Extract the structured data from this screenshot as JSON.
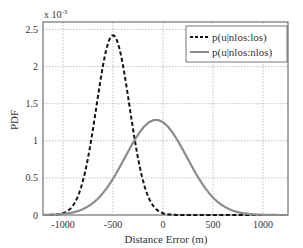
{
  "chart_data": {
    "type": "line",
    "title": "",
    "xlabel": "Distance Error (m)",
    "ylabel": "PDF",
    "y_scale_note": "x 10^-3",
    "y_multiplier_base": "x 10",
    "y_multiplier_exp": "-3",
    "xlim": [
      -1200,
      1250
    ],
    "ylim": [
      0,
      2.6
    ],
    "xticks": [
      -1000,
      -500,
      0,
      500,
      1000
    ],
    "xtick_labels": [
      "-1000",
      "-500",
      "0",
      "500",
      "1000"
    ],
    "yticks": [
      0,
      0.5,
      1,
      1.5,
      2,
      2.5
    ],
    "ytick_labels": [
      "0",
      "0.5",
      "1",
      "1.5",
      "2",
      "2.5"
    ],
    "grid": true,
    "legend_position": "upper right",
    "series": [
      {
        "name": "p(u|nlos:los)",
        "style": "dashed",
        "color": "#111111",
        "mean": -500,
        "std": 165,
        "peak": 2.42
      },
      {
        "name": "p(u|nlos:nlos)",
        "style": "solid",
        "color": "#8c8c8c",
        "mean": -70,
        "std": 310,
        "peak": 1.28
      }
    ]
  }
}
